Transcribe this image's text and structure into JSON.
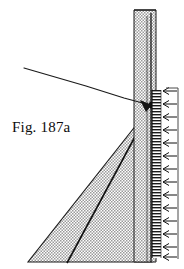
{
  "figure": {
    "caption": "Fig. 187a",
    "type": "engineering-line-drawing",
    "background_color": "#ffffff",
    "ink_color": "#111111",
    "stipple_fill_color": "#b4b4b4",
    "parts": {
      "wall_stem_label": "wall-stem",
      "soil_wedge_label": "soil-wedge",
      "ground_surface_label": "ground-surface-line",
      "failure_plane_label": "failure-plane-line",
      "pressure_arrows_label": "pressure-distribution-arrows",
      "reference_line_label": "vertical-reference-line",
      "node_label": "wall-top-junction-node"
    },
    "geometry": {
      "stem_left_x": 134,
      "stem_right_x": 156,
      "stem_top_y": 10,
      "stem_bottom_y": 262,
      "wedge_apex_x": 152,
      "wedge_apex_y": 105,
      "wedge_bottom_left_x": 28,
      "wedge_bottom_y": 262,
      "ground_line_start_x": 24,
      "ground_line_start_y": 68,
      "ground_line_end_x": 150,
      "ground_line_end_y": 105,
      "inner_line_bottom_x": 67,
      "reference_line_x": 178,
      "arrow_column_x": 166,
      "arrow_top_y": 90,
      "arrow_bottom_y": 258,
      "arrow_count": 14
    }
  }
}
